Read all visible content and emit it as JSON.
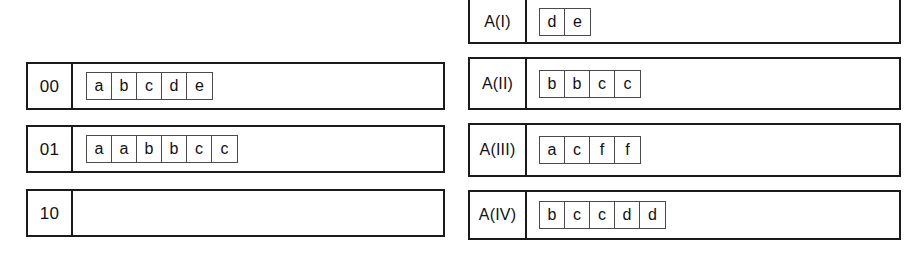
{
  "diagram": {
    "colors": {
      "outline": "#1b1b1b",
      "cell_outline": "#4a4a4a",
      "text": "#111111",
      "background": "#ffffff"
    },
    "left_column": {
      "name": "bucket-rows",
      "rows": [
        {
          "label": "00",
          "cells": [
            "a",
            "b",
            "c",
            "d",
            "e"
          ]
        },
        {
          "label": "01",
          "cells": [
            "a",
            "a",
            "b",
            "b",
            "c",
            "c"
          ]
        },
        {
          "label": "10",
          "cells": []
        }
      ]
    },
    "right_column": {
      "name": "array-rows",
      "rows": [
        {
          "label": "A(I)",
          "cells": [
            "d",
            "e"
          ]
        },
        {
          "label": "A(II)",
          "cells": [
            "b",
            "b",
            "c",
            "c"
          ]
        },
        {
          "label": "A(III)",
          "cells": [
            "a",
            "c",
            "f",
            "f"
          ]
        },
        {
          "label": "A(IV)",
          "cells": [
            "b",
            "c",
            "c",
            "d",
            "d"
          ]
        }
      ]
    }
  }
}
